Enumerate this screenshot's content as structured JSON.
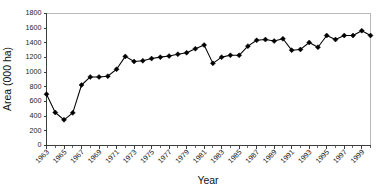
{
  "chart_data": {
    "type": "line",
    "title": "",
    "xlabel": "Year",
    "ylabel": "Area (000 ha)",
    "ylim": [
      0,
      1800
    ],
    "ytick_step": 200,
    "yticks": [
      0,
      200,
      400,
      600,
      800,
      1000,
      1200,
      1400,
      1600,
      1800
    ],
    "xlim": [
      1963,
      2000
    ],
    "xtick_labels": [
      "1963",
      "1965",
      "1967",
      "1969",
      "1971",
      "1973",
      "1975",
      "1977",
      "1979",
      "1981",
      "1983",
      "1985",
      "1987",
      "1989",
      "1991",
      "1993",
      "1995",
      "1997",
      "1999"
    ],
    "xtick_label_rotation": -45,
    "grid": false,
    "legend": false,
    "marker": "filled-diamond",
    "marker_color": "#000000",
    "line_color": "#000000",
    "x": [
      1963,
      1964,
      1965,
      1966,
      1967,
      1968,
      1969,
      1970,
      1971,
      1972,
      1973,
      1974,
      1975,
      1976,
      1977,
      1978,
      1979,
      1980,
      1981,
      1982,
      1983,
      1984,
      1985,
      1986,
      1987,
      1988,
      1989,
      1990,
      1991,
      1992,
      1993,
      1994,
      1995,
      1996,
      1997,
      1998,
      1999,
      2000
    ],
    "values": [
      700,
      450,
      350,
      445,
      825,
      935,
      935,
      945,
      1040,
      1215,
      1145,
      1155,
      1185,
      1205,
      1220,
      1245,
      1265,
      1320,
      1370,
      1120,
      1205,
      1230,
      1230,
      1355,
      1435,
      1445,
      1425,
      1455,
      1300,
      1310,
      1405,
      1340,
      1500,
      1445,
      1500,
      1500,
      1565,
      1500
    ],
    "series": [
      {
        "name": "Area",
        "values": [
          700,
          450,
          350,
          445,
          825,
          935,
          935,
          945,
          1040,
          1215,
          1145,
          1155,
          1185,
          1205,
          1220,
          1245,
          1265,
          1320,
          1370,
          1120,
          1205,
          1230,
          1230,
          1355,
          1435,
          1445,
          1425,
          1455,
          1300,
          1310,
          1405,
          1340,
          1500,
          1445,
          1500,
          1500,
          1565,
          1500
        ]
      }
    ]
  }
}
